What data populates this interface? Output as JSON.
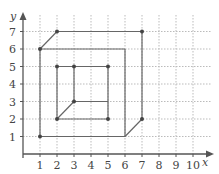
{
  "chart_data": {
    "type": "diagram",
    "title": "",
    "xlabel": "x",
    "ylabel": "y",
    "xlim": [
      0,
      10
    ],
    "ylim": [
      0,
      7
    ],
    "x_ticks": [
      "1",
      "2",
      "3",
      "4",
      "5",
      "6",
      "7",
      "8",
      "9",
      "10"
    ],
    "y_ticks": [
      "1",
      "2",
      "3",
      "4",
      "5",
      "6",
      "7"
    ],
    "grid": true,
    "shapes": [
      {
        "name": "outer-prism",
        "segments": [
          [
            [
              1,
              1
            ],
            [
              6,
              1
            ]
          ],
          [
            [
              6,
              1
            ],
            [
              6,
              6
            ]
          ],
          [
            [
              6,
              6
            ],
            [
              1,
              6
            ]
          ],
          [
            [
              1,
              6
            ],
            [
              1,
              1
            ]
          ],
          [
            [
              1,
              6
            ],
            [
              2,
              7
            ]
          ],
          [
            [
              2,
              7
            ],
            [
              7,
              7
            ]
          ],
          [
            [
              7,
              7
            ],
            [
              7,
              2
            ]
          ],
          [
            [
              7,
              2
            ],
            [
              6,
              1
            ]
          ]
        ],
        "points": [
          [
            1,
            1
          ],
          [
            1,
            6
          ],
          [
            2,
            7
          ],
          [
            7,
            7
          ],
          [
            7,
            2
          ]
        ]
      },
      {
        "name": "inner-prism",
        "segments": [
          [
            [
              2,
              2
            ],
            [
              5,
              2
            ]
          ],
          [
            [
              5,
              2
            ],
            [
              5,
              5
            ]
          ],
          [
            [
              5,
              5
            ],
            [
              2,
              5
            ]
          ],
          [
            [
              2,
              5
            ],
            [
              2,
              2
            ]
          ],
          [
            [
              3,
              5
            ],
            [
              3,
              3
            ]
          ],
          [
            [
              3,
              3
            ],
            [
              5,
              3
            ]
          ],
          [
            [
              2,
              2
            ],
            [
              3,
              3
            ]
          ]
        ],
        "points": [
          [
            2,
            2
          ],
          [
            2,
            5
          ],
          [
            3,
            5
          ],
          [
            5,
            5
          ],
          [
            5,
            2
          ],
          [
            3,
            3
          ]
        ]
      }
    ]
  },
  "colors": {
    "line": "#666666",
    "point": "#444444",
    "grid": "#bbbbbb",
    "axis": "#555555"
  }
}
